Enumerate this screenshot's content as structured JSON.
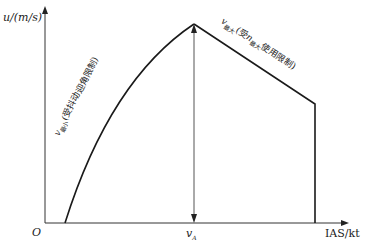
{
  "diagram": {
    "y_axis_label": "u/(m/s)",
    "x_axis_label": "IAS/kt",
    "origin_label": "O",
    "va_label_main": "v",
    "va_label_sub": "A",
    "curve_left_label": {
      "v": "v",
      "sub": "最小",
      "rest": "(受抖动迎角限制)"
    },
    "curve_right_label": {
      "v": "v",
      "sub": "最大",
      "mid": "(受",
      "n": "n",
      "nsub": "最大",
      "rest": "使用限制)"
    },
    "colors": {
      "line": "#1a1a1a",
      "axis": "#333333"
    }
  }
}
